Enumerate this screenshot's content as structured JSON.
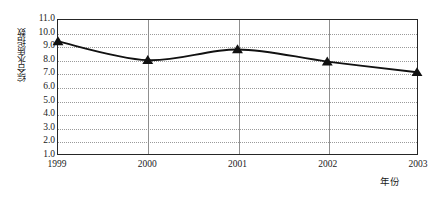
{
  "chart_data": {
    "type": "line",
    "title": "",
    "subtitle": "",
    "xlabel": "年份",
    "ylabel": "综合水质指数",
    "categories": [
      "1999",
      "2000",
      "2001",
      "2002",
      "2003"
    ],
    "x": [
      1999,
      2000,
      2001,
      2002,
      2003
    ],
    "values": [
      9.4,
      8.0,
      8.8,
      7.9,
      7.1
    ],
    "series": [
      {
        "name": "综合水质指数",
        "values": [
          9.4,
          8.0,
          8.8,
          7.9,
          7.1
        ]
      }
    ],
    "ylim": [
      1.0,
      11.0
    ],
    "ytick_labels": [
      "11.0",
      "10.0",
      "9.0",
      "8.0",
      "7.0",
      "6.0",
      "5.0",
      "4.0",
      "3.0",
      "2.0",
      "1.0"
    ],
    "ytick_values": [
      11.0,
      10.0,
      9.0,
      8.0,
      7.0,
      6.0,
      5.0,
      4.0,
      3.0,
      2.0,
      1.0
    ],
    "xtick_labels": [
      "1999",
      "2000",
      "2001",
      "2002",
      "2003"
    ],
    "grid": {
      "horizontal": true,
      "horizontal_style": "dotted",
      "vertical": true,
      "vertical_style": "solid",
      "vertical_at": [
        "2000",
        "2001",
        "2002"
      ]
    },
    "legend": {
      "visible": false,
      "position": "none",
      "entries": []
    },
    "marker": "triangle",
    "colors": {
      "line": "#111111",
      "marker": "#111111",
      "axis": "#262626",
      "hgrid": "#9a9a9a",
      "vgrid": "#8f8f8f",
      "background": "#ffffff",
      "text": "#1a1a1a"
    },
    "annotations": []
  }
}
